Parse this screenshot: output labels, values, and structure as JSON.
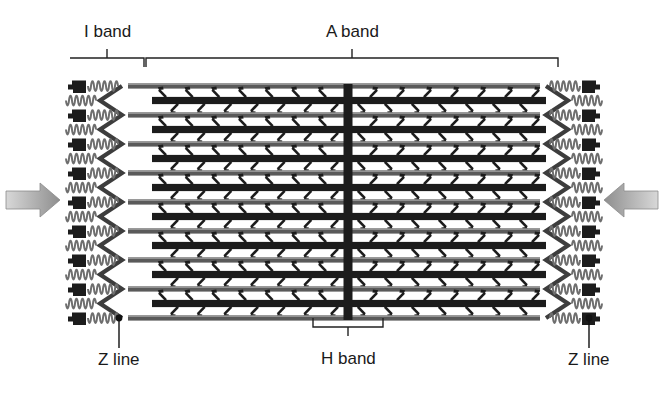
{
  "figure": {
    "type": "biological-diagram",
    "background_color": "#ffffff"
  },
  "labels": {
    "i_band": "I band",
    "a_band": "A band",
    "h_band": "H band",
    "z_line_left": "Z line",
    "z_line_right": "Z line"
  },
  "colors": {
    "thick_filament": "#1c1c1c",
    "thin_filament": "#5a5a5a",
    "z_line": "#3d3d3d",
    "titin_spring": "#6e6e6e",
    "m_line": "#1c1c1c",
    "bracket": "#222222",
    "text": "#1a1a1a",
    "arrow": "#9b9b9b"
  },
  "structure": {
    "thin_filament_count": 9,
    "thick_filament_count": 8,
    "myosin_head_pairs_per_half": 7,
    "array_top_y": 86,
    "array_bottom_y": 318,
    "m_line_x": 348,
    "z_line_left_x": 122,
    "z_line_right_x": 546
  },
  "brackets": {
    "i_band": {
      "x1": 70,
      "x2": 144,
      "y": 58,
      "tick_x": 107
    },
    "a_band": {
      "x1": 146,
      "x2": 558,
      "y": 58,
      "tick_x": 352
    },
    "h_band": {
      "x1": 313,
      "x2": 383,
      "y": 327,
      "tick_x": 348
    }
  },
  "leaders": {
    "z_line_left": {
      "dot_x": 119,
      "dot_y": 318,
      "text_y": 362
    },
    "z_line_right": {
      "dot_x": 589,
      "dot_y": 318,
      "text_y": 362
    }
  },
  "arrows": {
    "left": {
      "direction": "right",
      "x": 6,
      "y": 200
    },
    "right": {
      "direction": "left",
      "x": 658,
      "y": 200
    }
  }
}
